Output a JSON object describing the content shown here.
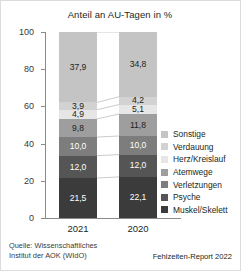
{
  "chart_data": {
    "type": "bar",
    "subtype": "100% stacked column",
    "title": "Anteil an AU-Tagen in %",
    "xlabel": "",
    "ylabel": "",
    "ylim": [
      0,
      100
    ],
    "yticks": [
      0,
      20,
      40,
      60,
      80,
      100
    ],
    "ytick_labels": [
      "0",
      "20",
      "40",
      "60",
      "80",
      "100"
    ],
    "grid": false,
    "legend_position": "right",
    "categories": [
      "2021",
      "2020"
    ],
    "series": [
      {
        "name": "Muskel/Skelett",
        "color": "#3b3b3b",
        "values": [
          21.5,
          22.1
        ],
        "labels": [
          "21,5",
          "22,1"
        ]
      },
      {
        "name": "Psyche",
        "color": "#555555",
        "values": [
          12.0,
          12.0
        ],
        "labels": [
          "12,0",
          "12,0"
        ]
      },
      {
        "name": "Verletzungen",
        "color": "#7d7d7d",
        "values": [
          10.0,
          10.0
        ],
        "labels": [
          "10,0",
          "10,0"
        ]
      },
      {
        "name": "Atemwege",
        "color": "#9e9e9e",
        "values": [
          9.8,
          11.8
        ],
        "labels": [
          "9,8",
          "11,8"
        ]
      },
      {
        "name": "Herz/Kreislauf",
        "color": "#e6e6e6",
        "values": [
          4.9,
          5.1
        ],
        "labels": [
          "4,9",
          "5,1"
        ]
      },
      {
        "name": "Verdauung",
        "color": "#d2d2d2",
        "values": [
          3.9,
          4.2
        ],
        "labels": [
          "3,9",
          "4,2"
        ]
      },
      {
        "name": "Sonstige",
        "color": "#c4c4c4",
        "values": [
          37.9,
          34.8
        ],
        "labels": [
          "37,9",
          "34,8"
        ]
      }
    ],
    "legend_entries": [
      {
        "label": "Sonstige",
        "color": "#c4c4c4"
      },
      {
        "label": "Verdauung",
        "color": "#d2d2d2"
      },
      {
        "label": "Herz/Kreislauf",
        "color": "#e6e6e6"
      },
      {
        "label": "Atemwege",
        "color": "#9e9e9e"
      },
      {
        "label": "Verletzungen",
        "color": "#7d7d7d"
      },
      {
        "label": "Psyche",
        "color": "#555555"
      },
      {
        "label": "Muskel/Skelett",
        "color": "#3b3b3b"
      }
    ]
  },
  "footer": {
    "source_line1": "Quelle: Wissenschaftliches",
    "source_line2": "Institut der AOK (WIdO)",
    "report": "Fehlzeiten-Report 2022"
  },
  "colors": {
    "axis": "#8a8a8a",
    "connector": "#b5b5b5",
    "text_dark": "#231f20",
    "text_light": "#ffffff",
    "background": "#ffffff",
    "border": "#dcdcdc"
  }
}
